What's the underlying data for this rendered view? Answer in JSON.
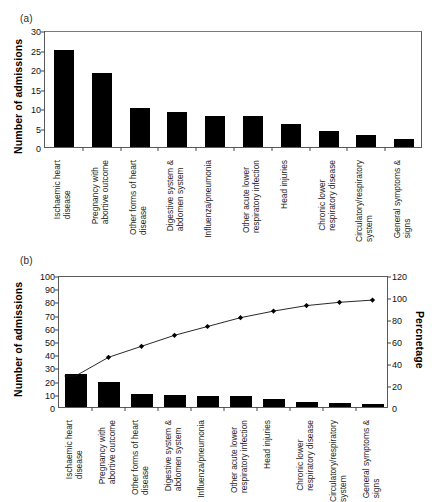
{
  "figure": {
    "panel_a_tag": "(a)",
    "panel_b_tag": "(b)"
  },
  "categories": [
    "Ischaemic heart\ndisease",
    "Pregnancy with\nabortive outcome",
    "Other forms of heart\ndisease",
    "Digestive system &\nabdomen system",
    "Influenza/pneumonia",
    "Other acute lower\nrespiratory infection",
    "Head injuries",
    "Chronic lower\nrespiratory disease",
    "Circulatory/respiratory\nsystem",
    "General symptoms &\nsigns"
  ],
  "panel_a": {
    "ylabel": "Number of admissions",
    "yticks": [
      "0",
      "5",
      "10",
      "15",
      "20",
      "25",
      "30"
    ]
  },
  "panel_b": {
    "ylabel_left": "Number of admissions",
    "ylabel_right": "Percnetage",
    "yticks_left": [
      "0",
      "10",
      "20",
      "30",
      "40",
      "50",
      "60",
      "70",
      "80",
      "90",
      "100"
    ],
    "yticks_right": [
      "0",
      "20",
      "40",
      "60",
      "80",
      "100",
      "120"
    ]
  },
  "chart_data": [
    {
      "type": "bar",
      "panel": "(a)",
      "title": "",
      "xlabel": "",
      "ylabel": "Number of admissions",
      "ylim": [
        0,
        30
      ],
      "ytick_step": 5,
      "grid": false,
      "legend": "none",
      "bar_color": "#000000",
      "categories": [
        "Ischaemic heart disease",
        "Pregnancy with abortive outcome",
        "Other forms of heart disease",
        "Digestive system & abdomen system",
        "Influenza/pneumonia",
        "Other acute lower respiratory infection",
        "Head injuries",
        "Chronic lower respiratory disease",
        "Circulatory/respiratory system",
        "General symptoms & signs"
      ],
      "values": [
        25,
        19,
        10,
        9,
        8,
        8,
        6,
        4,
        3,
        2
      ]
    },
    {
      "type": "bar",
      "panel": "(b)",
      "title": "",
      "xlabel": "",
      "ylabel": "Number of admissions",
      "ylabel_secondary": "Percnetage",
      "ylim": [
        0,
        100
      ],
      "ytick_step": 10,
      "ylim_secondary": [
        0,
        120
      ],
      "ytick_step_secondary": 20,
      "grid": false,
      "legend": "none",
      "bar_color": "#000000",
      "line_color": "#000000",
      "categories": [
        "Ischaemic heart disease",
        "Pregnancy with abortive outcome",
        "Other forms of heart disease",
        "Digestive system & abdomen system",
        "Influenza/pneumonia",
        "Other acute lower respiratory infection",
        "Head injuries",
        "Chronic lower respiratory disease",
        "Circulatory/respiratory system",
        "General symptoms & signs"
      ],
      "series": [
        {
          "name": "Number of admissions",
          "axis": "left",
          "render": "bar",
          "values": [
            25,
            19,
            10,
            9,
            8,
            8,
            6,
            4,
            3,
            2
          ]
        },
        {
          "name": "Cumulative percentage",
          "axis": "right",
          "render": "line",
          "marker": "diamond",
          "values": [
            30,
            47,
            57,
            67,
            75,
            83,
            89,
            94,
            97,
            99
          ]
        }
      ]
    }
  ]
}
